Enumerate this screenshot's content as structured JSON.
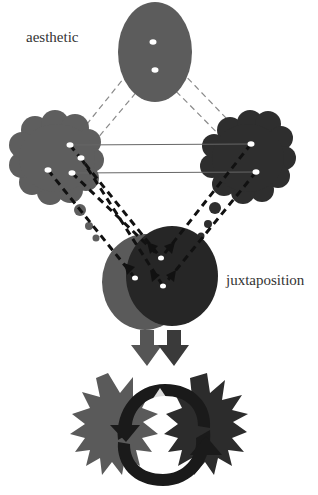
{
  "labels": {
    "aesthetic": "aesthetic",
    "juxtaposition": "juxtaposition"
  },
  "colors": {
    "top_ellipse": "#5c5c5c",
    "left_cloud": "#5e5e5e",
    "right_cloud": "#2e2e2e",
    "left_circle": "#5a5a5a",
    "right_circle": "#262626",
    "arrow_left": "#555555",
    "arrow_right": "#3a3a3a",
    "star_left": "#5a5a5a",
    "star_right": "#2c2c2c",
    "cycle_arrows": "#1a1a1a",
    "dash_light": "#8a8a8a",
    "dash_bold": "#111111",
    "connector": "#666666"
  },
  "nodes": [
    {
      "id": "top-ellipse",
      "label": "aesthetic"
    },
    {
      "id": "left-cloud"
    },
    {
      "id": "right-cloud"
    },
    {
      "id": "overlapping-circles",
      "label": "juxtaposition"
    },
    {
      "id": "down-arrows"
    },
    {
      "id": "cycle-starburst"
    }
  ]
}
